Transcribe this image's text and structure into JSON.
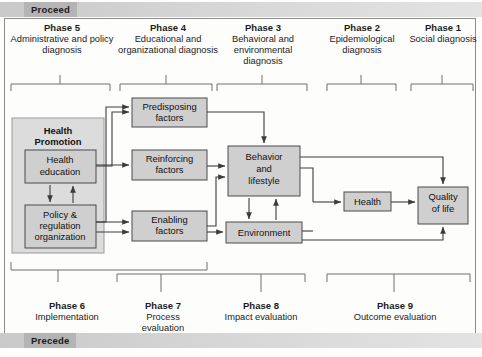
{
  "banners": {
    "top_label": "Proceed",
    "bottom_label": "Precede"
  },
  "top_phases": [
    {
      "name": "Phase 5",
      "desc": "Administrative and policy diagnosis"
    },
    {
      "name": "Phase 4",
      "desc": "Educational and organizational diagnosis"
    },
    {
      "name": "Phase 3",
      "desc": "Behavioral and environmental diagnosis"
    },
    {
      "name": "Phase 2",
      "desc": "Epidemiological diagnosis"
    },
    {
      "name": "Phase 1",
      "desc": "Social diagnosis"
    }
  ],
  "bottom_phases": [
    {
      "name": "Phase 6",
      "desc": "Implementation"
    },
    {
      "name": "Phase 7",
      "desc": "Process evaluation"
    },
    {
      "name": "Phase 8",
      "desc": "Impact evaluation"
    },
    {
      "name": "Phase 9",
      "desc": "Outcome evaluation"
    }
  ],
  "boxes": {
    "health_promotion": "Health Promotion",
    "health_education": "Health education",
    "policy_regulation": "Policy & regulation organization",
    "predisposing": "Predisposing factors",
    "reinforcing": "Reinforcing factors",
    "enabling": "Enabling factors",
    "behavior": "Behavior and lifestyle",
    "environment": "Environment",
    "health": "Health",
    "quality_of_life": "Quality of life"
  },
  "colors": {
    "box_fill": "#cfcfcf",
    "container_fill": "#dcdcdc",
    "banner_chip": "#b4b4b4",
    "line": "#3c3c3c"
  }
}
